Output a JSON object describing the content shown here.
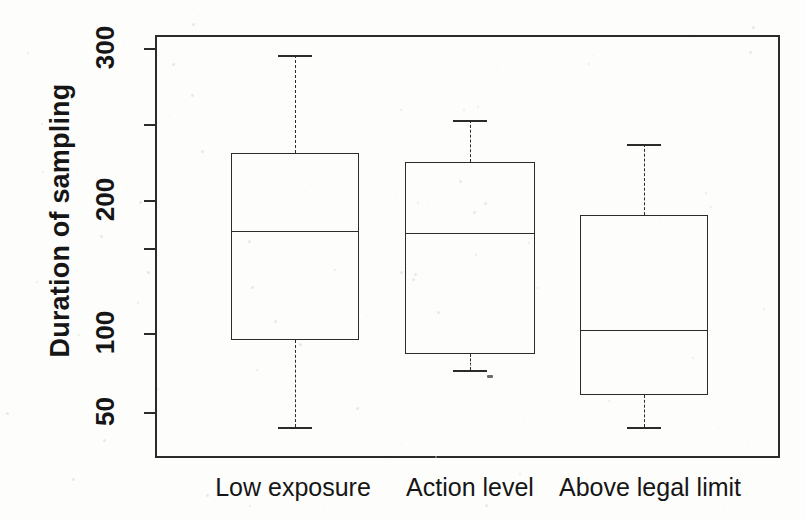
{
  "chart_data": {
    "type": "box",
    "title": "",
    "xlabel": "",
    "ylabel": "Duration of sampling",
    "categories": [
      "Low exposure",
      "Action level",
      "Above legal limit"
    ],
    "y_tick_labels": [
      "300",
      "200",
      "100",
      "50"
    ],
    "y_tick_values": [
      300,
      200,
      100,
      50
    ],
    "y_minor_ticks": [
      250,
      150
    ],
    "ylim": [
      40,
      330
    ],
    "grid": false,
    "legend": "none",
    "axis_scale": "log-like (compressed upper range)",
    "boxes": [
      {
        "category": "Low exposure",
        "whisker_low": 42,
        "q1": 97,
        "median": 170,
        "q3": 232,
        "whisker_high": 297
      },
      {
        "category": "Action level",
        "whisker_low": 78,
        "q1": 88,
        "median": 168,
        "q3": 226,
        "whisker_high": 254
      },
      {
        "category": "Above legal limit",
        "whisker_low": 42,
        "q1": 62,
        "median": 103,
        "q3": 186,
        "whisker_high": 238
      }
    ]
  },
  "figure": {
    "background_color": "#fdfdfc",
    "ink_color": "#2b2b2b"
  }
}
